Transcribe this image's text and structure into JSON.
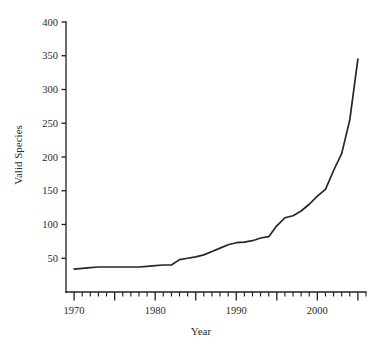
{
  "chart_data": {
    "type": "line",
    "title": "",
    "xlabel": "Year",
    "ylabel": "Valid Species",
    "xlim": [
      1969.0,
      2006.0
    ],
    "ylim": [
      0,
      400
    ],
    "grid": false,
    "legend": "none",
    "x_ticks_major": [
      1970,
      1975,
      1980,
      1985,
      1990,
      1995,
      2000,
      2005
    ],
    "x_tick_labels": [
      "1970",
      "",
      "1980",
      "",
      "1990",
      "",
      "2000",
      ""
    ],
    "x_ticks_minor_step": 1,
    "y_ticks": [
      50,
      100,
      150,
      200,
      250,
      300,
      350,
      400
    ],
    "y_tick_labels": [
      "50",
      "100",
      "150",
      "200",
      "250",
      "300",
      "350",
      "400"
    ],
    "series": [
      {
        "name": "Valid Species",
        "color": "#262626",
        "x": [
          1970,
          1971,
          1972,
          1973,
          1974,
          1975,
          1976,
          1977,
          1978,
          1979,
          1980,
          1981,
          1982,
          1983,
          1984,
          1985,
          1986,
          1987,
          1988,
          1989,
          1990,
          1991,
          1992,
          1993,
          1994,
          1995,
          1996,
          1997,
          1998,
          1999,
          2000,
          2001,
          2002,
          2003,
          2004,
          2005
        ],
        "values": [
          34,
          35,
          36,
          37,
          37,
          37,
          37,
          37,
          37,
          38,
          39,
          40,
          40,
          48,
          50,
          52,
          55,
          60,
          65,
          70,
          73,
          74,
          76,
          80,
          82,
          98,
          110,
          113,
          120,
          130,
          142,
          152,
          180,
          205,
          255,
          345
        ]
      }
    ]
  },
  "axes": {
    "ylabel": "Valid Species",
    "xlabel": "Year"
  }
}
